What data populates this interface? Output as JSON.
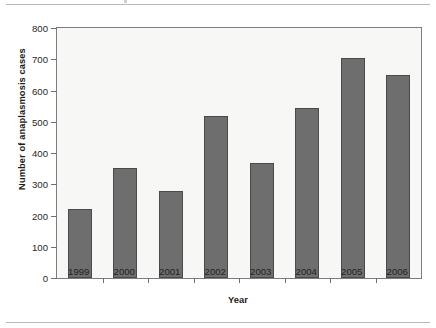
{
  "chart_data": {
    "type": "bar",
    "title": "",
    "xlabel": "Year",
    "ylabel": "Number of anaplasmosis cases",
    "categories": [
      "1999",
      "2000",
      "2001",
      "2002",
      "2003",
      "2004",
      "2005",
      "2006"
    ],
    "values": [
      220,
      352,
      278,
      518,
      368,
      544,
      704,
      650
    ],
    "ylim": [
      0,
      800
    ],
    "yticks": [
      "0",
      "100",
      "200",
      "300",
      "400",
      "500",
      "600",
      "700",
      "800"
    ],
    "ytick_values": [
      0,
      100,
      200,
      300,
      400,
      500,
      600,
      700,
      800
    ],
    "grid": false,
    "legend": "none",
    "bar_color": "#6e6e6e",
    "bar_border_color": "#4a4a4a",
    "plot_background": "#f7f7f5",
    "axis_color": "#7d7d7d",
    "text_color": "#1f1f1f"
  },
  "figure": {
    "rule_color": "#b9b9b9"
  }
}
